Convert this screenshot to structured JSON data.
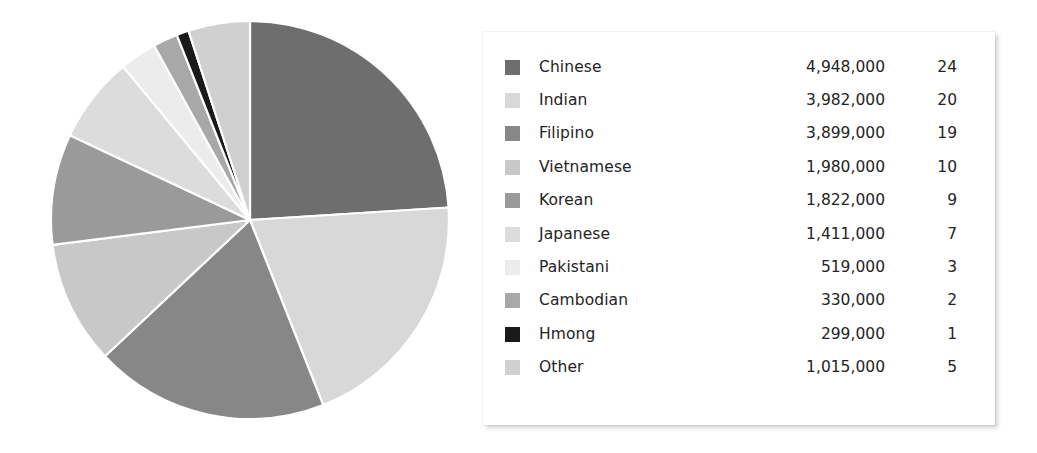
{
  "chart_data": {
    "type": "pie",
    "title": "",
    "subtitle": "",
    "xlabel": "",
    "ylabel": "",
    "legend_position": "right",
    "grid": false,
    "start_angle_deg": 0,
    "direction": "clockwise",
    "value_unit": "people",
    "percent_unit": "%",
    "categories": [
      "Chinese",
      "Indian",
      "Filipino",
      "Vietnamese",
      "Korean",
      "Japanese",
      "Pakistani",
      "Cambodian",
      "Hmong",
      "Other"
    ],
    "values": [
      4948000,
      3982000,
      3899000,
      1980000,
      1822000,
      1411000,
      519000,
      330000,
      299000,
      1015000
    ],
    "percents": [
      24,
      20,
      19,
      10,
      9,
      7,
      3,
      2,
      1,
      5
    ],
    "colors": [
      "#6e6e6e",
      "#d8d8d8",
      "#878787",
      "#c8c8c8",
      "#9a9a9a",
      "#dcdcdc",
      "#ececec",
      "#a8a8a8",
      "#1a1a1a",
      "#d0d0d0"
    ],
    "slice_separator_color": "#ffffff"
  },
  "legend": {
    "rows": [
      {
        "label": "Chinese",
        "value": "4,948,000",
        "percent": "24",
        "color": "#6e6e6e"
      },
      {
        "label": "Indian",
        "value": "3,982,000",
        "percent": "20",
        "color": "#d8d8d8"
      },
      {
        "label": "Filipino",
        "value": "3,899,000",
        "percent": "19",
        "color": "#878787"
      },
      {
        "label": "Vietnamese",
        "value": "1,980,000",
        "percent": "10",
        "color": "#c8c8c8"
      },
      {
        "label": "Korean",
        "value": "1,822,000",
        "percent": "9",
        "color": "#9a9a9a"
      },
      {
        "label": "Japanese",
        "value": "1,411,000",
        "percent": "7",
        "color": "#dcdcdc"
      },
      {
        "label": "Pakistani",
        "value": "519,000",
        "percent": "3",
        "color": "#ececec"
      },
      {
        "label": "Cambodian",
        "value": "330,000",
        "percent": "2",
        "color": "#a8a8a8"
      },
      {
        "label": "Hmong",
        "value": "299,000",
        "percent": "1",
        "color": "#1a1a1a"
      },
      {
        "label": "Other",
        "value": "1,015,000",
        "percent": "5",
        "color": "#d0d0d0"
      }
    ]
  },
  "pie_geometry": {
    "cx": 200,
    "cy": 200,
    "r": 199
  }
}
